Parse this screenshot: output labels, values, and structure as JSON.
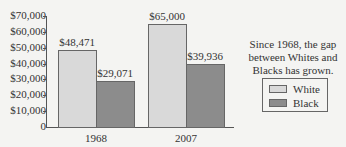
{
  "chart_data": {
    "type": "bar",
    "title": "",
    "xlabel": "",
    "ylabel": "",
    "categories": [
      "1968",
      "2007"
    ],
    "series": [
      {
        "name": "White",
        "values": [
          48471,
          65000
        ],
        "color": "#d9d9d9"
      },
      {
        "name": "Black",
        "values": [
          29071,
          39936
        ],
        "color": "#8c8c8c"
      }
    ],
    "data_labels": [
      [
        "$48,471",
        "$65,000"
      ],
      [
        "$29,071",
        "$39,936"
      ]
    ],
    "ylim": [
      0,
      70000
    ],
    "yticks": [
      0,
      10000,
      20000,
      30000,
      40000,
      50000,
      60000,
      70000
    ],
    "ytick_labels": [
      "0",
      "$10,000",
      "$20,000",
      "$30,000",
      "$40,000",
      "$50,000",
      "$60,000",
      "$70,000"
    ],
    "grid": false,
    "legend_position": "right",
    "annotation": "Since 1968, the gap between Whites and Blacks has grown."
  },
  "annotation_lines": [
    "Since 1968, the gap",
    "between Whites and",
    "Blacks has grown."
  ],
  "legend": {
    "white_label": "White",
    "black_label": "Black"
  }
}
